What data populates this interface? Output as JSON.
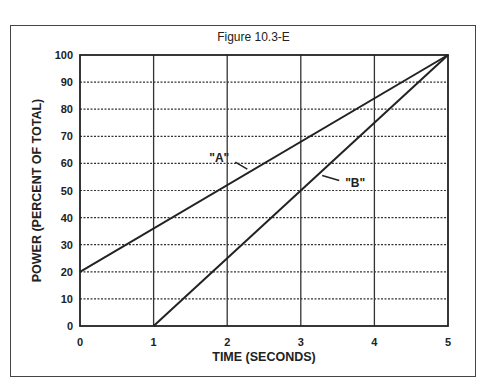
{
  "figure": {
    "title": "Figure 10.3-E"
  },
  "chart_data": {
    "type": "line",
    "title": "Figure 10.3-E",
    "xlabel": "TIME (SECONDS)",
    "ylabel": "POWER (PERCENT OF TOTAL)",
    "xlim": [
      0,
      5
    ],
    "ylim": [
      0,
      100
    ],
    "x_ticks": [
      "0",
      "1",
      "2",
      "3",
      "4",
      "5"
    ],
    "y_ticks": [
      "0",
      "10",
      "20",
      "30",
      "40",
      "50",
      "60",
      "70",
      "80",
      "90",
      "100"
    ],
    "grid": true,
    "series": [
      {
        "name": "\"A\"",
        "x": [
          0,
          5
        ],
        "y": [
          20,
          100
        ]
      },
      {
        "name": "\"B\"",
        "x": [
          1,
          5
        ],
        "y": [
          0,
          100
        ]
      }
    ],
    "annotations": [
      {
        "text": "\"A\"",
        "points_to": "series A near x=2.3"
      },
      {
        "text": "\"B\"",
        "points_to": "series B near x=3.3"
      }
    ]
  }
}
